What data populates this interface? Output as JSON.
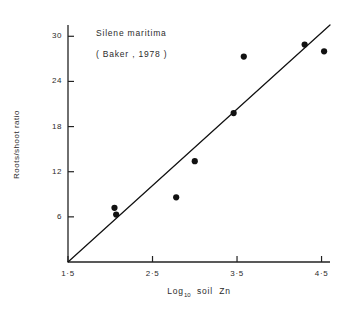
{
  "chart_data": {
    "type": "scatter",
    "title": "",
    "xlabel": "Log10 soil Zn",
    "ylabel": "Roots/shoot ratio",
    "xlim": [
      1.5,
      4.6
    ],
    "ylim": [
      0,
      31.5
    ],
    "grid": false,
    "legend": null,
    "x_ticks": [
      {
        "value": 1.5,
        "label": "1·5"
      },
      {
        "value": 2.5,
        "label": "2·5"
      },
      {
        "value": 3.5,
        "label": "3·5"
      },
      {
        "value": 4.5,
        "label": "4·5"
      }
    ],
    "y_ticks": [
      {
        "value": 6,
        "label": "6"
      },
      {
        "value": 12,
        "label": "12"
      },
      {
        "value": 18,
        "label": "18"
      },
      {
        "value": 24,
        "label": "24"
      },
      {
        "value": 30,
        "label": "30"
      }
    ],
    "series": [
      {
        "name": "Silene maritima observations",
        "marker": "filled-circle",
        "color": "#111111",
        "points": [
          {
            "x": 2.05,
            "y": 7.2
          },
          {
            "x": 2.07,
            "y": 6.3
          },
          {
            "x": 2.78,
            "y": 8.6
          },
          {
            "x": 3.0,
            "y": 13.4
          },
          {
            "x": 3.46,
            "y": 19.8
          },
          {
            "x": 3.58,
            "y": 27.3
          },
          {
            "x": 4.3,
            "y": 28.9
          },
          {
            "x": 4.53,
            "y": 28.0
          }
        ]
      }
    ],
    "fit_line": {
      "name": "fitted regression line",
      "color": "#111111",
      "start": {
        "x": 1.5,
        "y": 0
      },
      "end": {
        "x": 4.6,
        "y": 31.5
      }
    },
    "annotations": [
      {
        "id": "species",
        "text": "Silene  maritima",
        "x": 2.28,
        "y": 29.4
      },
      {
        "id": "citation",
        "text": "( Baker , 1978 )",
        "x": 2.28,
        "y": 26.9
      }
    ]
  }
}
